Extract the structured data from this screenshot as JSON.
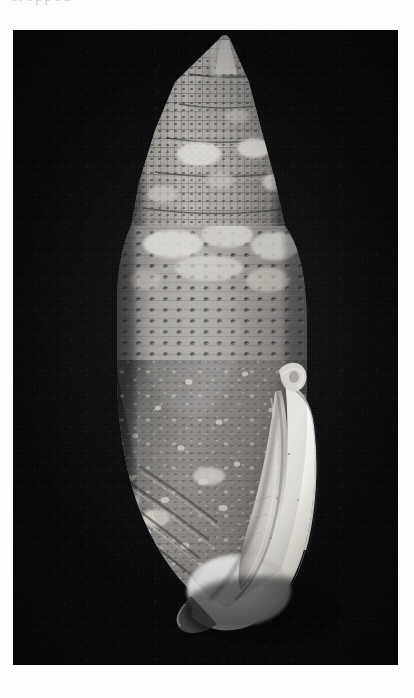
{
  "page": {
    "background_color": "#fdfdfd",
    "top_text_remnant": "cropped",
    "caption": ""
  },
  "plate": {
    "name": "shell-photograph",
    "background_color": "#070707",
    "frame": {
      "x": 13,
      "y": 30,
      "width": 385,
      "height": 635
    },
    "subject": "marine gastropod shell",
    "view": "apertural view, apex up",
    "lighting": "directional from upper left",
    "tone": "black and white halftone"
  },
  "specimen": {
    "label": "",
    "form": "fusiform mitriform shell",
    "apex": {
      "x": 220,
      "y": 118
    },
    "base": {
      "x": 222,
      "y": 602
    },
    "widest_y": 318,
    "left_edge_x": 122,
    "right_edge_x": 300,
    "colors": {
      "body_light": "#d8d6d2",
      "body_mid": "#8e8c88",
      "body_dark": "#3a3936",
      "bead_dark": "#232220",
      "blotch_white": "#f2f1ee",
      "aperture_white": "#fbfaf7",
      "aperture_shadow": "#9a9892",
      "background": "#070707"
    },
    "features": [
      {
        "name": "spire",
        "description": "high pointed conical spire with stepped whorls"
      },
      {
        "name": "whorl-bands",
        "description": "horizontal spiral cords crossed by axial riblets"
      },
      {
        "name": "beads",
        "description": "rows of dark punctate beads in a reticulate grid"
      },
      {
        "name": "white-blotches",
        "description": "irregular pale blotches on shoulder and spire"
      },
      {
        "name": "body-whorl",
        "description": "large inflated body whorl, finely speckled"
      },
      {
        "name": "outer-lip",
        "description": "long white outer lip curving from shoulder to base"
      },
      {
        "name": "aperture",
        "description": "narrow elongate aperture, brilliant white"
      },
      {
        "name": "siphonal-canal",
        "description": "short twisted canal at the base"
      },
      {
        "name": "columellar-folds",
        "description": "oblique plaits along the columella"
      }
    ]
  }
}
